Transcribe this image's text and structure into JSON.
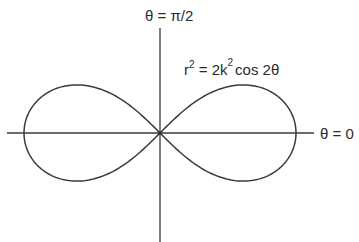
{
  "diagram": {
    "type": "polar-curve",
    "curve_name": "lemniscate of Bernoulli",
    "labels": {
      "vertical_axis": "θ = π/2",
      "horizontal_axis": "θ = 0",
      "equation": {
        "lhs_base": "r",
        "lhs_exp": "2",
        "eq_coeff": " = 2k",
        "coeff_exp": "2",
        "rhs": "cos 2θ"
      }
    },
    "colors": {
      "stroke": "#3a3a3a",
      "text": "#2b2b2b",
      "background": "#ffffff"
    }
  }
}
